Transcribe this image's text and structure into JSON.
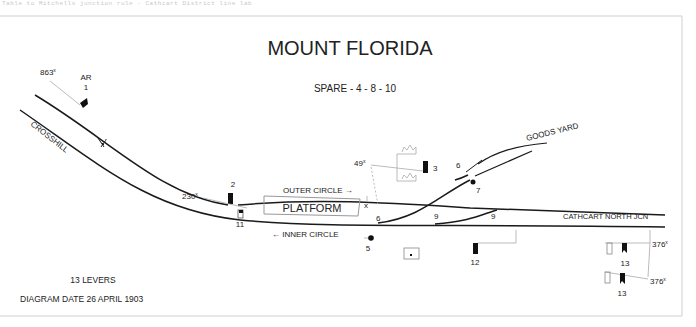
{
  "page": {
    "top_caption": "Table to Mitchells junction rule - Cathcart District line lab",
    "title": "MOUNT FLORIDA",
    "spare_levers": "SPARE - 4 - 8 - 10",
    "lever_count": "13 LEVERS",
    "diagram_date": "DIAGRAM DATE  26 APRIL 1903"
  },
  "track_labels": {
    "crosshill": "CROSSHILL",
    "goods_yard": "GOODS YARD",
    "outer_circle": "OUTER CIRCLE →",
    "inner_circle": "← INNER CIRCLE",
    "cathcart_north": "CATHCART NORTH JCN",
    "platform": "PLATFORM"
  },
  "distances": {
    "d863": "863",
    "d230": "230",
    "d49": "49",
    "d376a": "376",
    "d376b": "376",
    "sup": "x"
  },
  "levers": {
    "ar": "AR",
    "l1": "1",
    "l2": "2",
    "l3": "3",
    "l5": "5",
    "l6a": "6",
    "l6b": "6",
    "l7": "7",
    "l9a": "9",
    "l9b": "9",
    "l11": "11",
    "l12": "12",
    "l13a": "13",
    "l13b": "13",
    "x_mark": "x"
  },
  "colors": {
    "track": "#1a1a1a",
    "signal": "#111111",
    "guide": "#aaaaaa",
    "frame": "#cccccc"
  }
}
